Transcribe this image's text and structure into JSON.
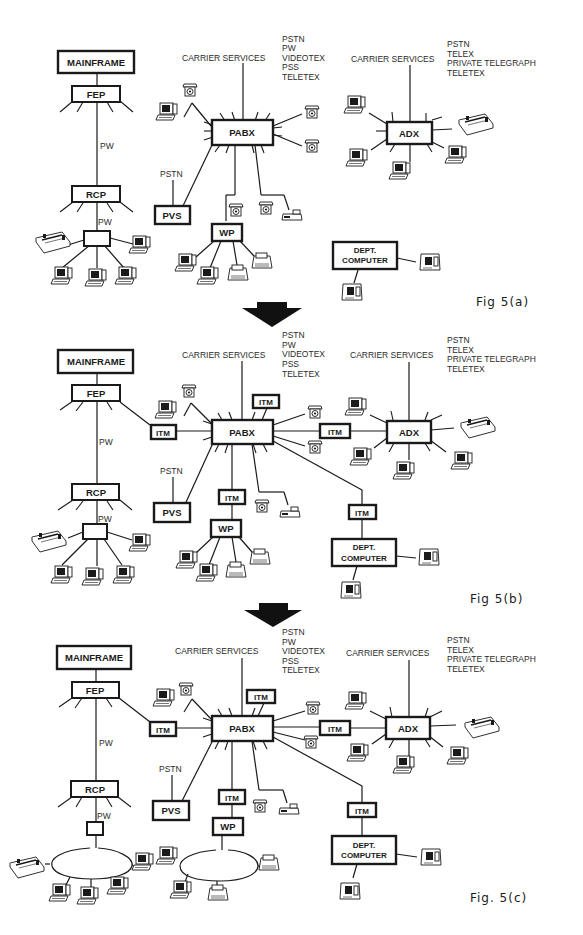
{
  "document": {
    "title": "Network evolution diagrams",
    "transition_arrow": "down-arrow"
  },
  "figures": [
    {
      "caption": "Fig 5(a)",
      "nodes": {
        "mainframe": "MAINFRAME",
        "fep": "FEP",
        "rcp": "RCP",
        "pabx": "PABX",
        "pvs": "PVS",
        "wp": "WP",
        "adx": "ADX",
        "dept_computer_line1": "DEPT.",
        "dept_computer_line2": "COMPUTER"
      },
      "labels": {
        "pw_link": "PW",
        "pw_local": "PW",
        "pvs_pstn": "PSTN",
        "pabx_carrier": "CARRIER SERVICES",
        "adx_carrier": "CARRIER SERVICES"
      },
      "pabx_services": [
        "PSTN",
        "PW",
        "VIDEOTEX",
        "PSS",
        "TELETEX"
      ],
      "adx_services": [
        "PSTN",
        "TELEX",
        "PRIVATE TELEGRAPH",
        "TELETEX"
      ],
      "itm_units": []
    },
    {
      "caption": "Fig 5(b)",
      "nodes": {
        "mainframe": "MAINFRAME",
        "fep": "FEP",
        "rcp": "RCP",
        "pabx": "PABX",
        "pvs": "PVS",
        "wp": "WP",
        "adx": "ADX",
        "dept_computer_line1": "DEPT.",
        "dept_computer_line2": "COMPUTER"
      },
      "labels": {
        "pw_link": "PW",
        "pw_local": "PW",
        "pvs_pstn": "PSTN",
        "pabx_carrier": "CARRIER SERVICES",
        "adx_carrier": "CARRIER SERVICES"
      },
      "pabx_services": [
        "PSTN",
        "PW",
        "VIDEOTEX",
        "PSS",
        "TELETEX"
      ],
      "adx_services": [
        "PSTN",
        "TELEX",
        "PRIVATE TELEGRAPH",
        "TELETEX"
      ],
      "itm_units": [
        "ITM",
        "ITM",
        "ITM",
        "ITM",
        "ITM"
      ]
    },
    {
      "caption": "Fig. 5(c)",
      "nodes": {
        "mainframe": "MAINFRAME",
        "fep": "FEP",
        "rcp": "RCP",
        "pabx": "PABX",
        "pvs": "PVS",
        "wp": "WP",
        "adx": "ADX",
        "dept_computer_line1": "DEPT.",
        "dept_computer_line2": "COMPUTER"
      },
      "labels": {
        "pw_link": "PW",
        "pw_local": "PW",
        "pvs_pstn": "PSTN",
        "pabx_carrier": "CARRIER  SERVICES",
        "adx_carrier": "CARRIER  SERVICES"
      },
      "pabx_services": [
        "PSTN",
        "PW",
        "VIDEOTEX",
        "PSS",
        "TELETEX"
      ],
      "adx_services": [
        "PSTN",
        "TELEX",
        "PRIVATE TELEGRAPH",
        "TELETEX"
      ],
      "itm_units": [
        "ITM",
        "ITM",
        "ITM",
        "ITM",
        "ITM"
      ]
    }
  ]
}
